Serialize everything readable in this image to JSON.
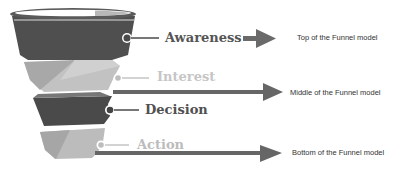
{
  "diagram": {
    "stages": [
      {
        "label": "Awareness",
        "color": "#555555",
        "shade": "dark"
      },
      {
        "label": "Interest",
        "color": "#c4c4c4",
        "shade": "light"
      },
      {
        "label": "Decision",
        "color": "#555555",
        "shade": "dark"
      },
      {
        "label": "Action",
        "color": "#b8b8b8",
        "shade": "light"
      }
    ],
    "descriptions": [
      {
        "text": "Top of the Funnel model"
      },
      {
        "text": "Middle of the Funnel model"
      },
      {
        "text": "Bottom of the Funnel model"
      }
    ],
    "colors": {
      "dark": "#505050",
      "light": "#b0b0b0",
      "arrow": "#707070"
    }
  }
}
